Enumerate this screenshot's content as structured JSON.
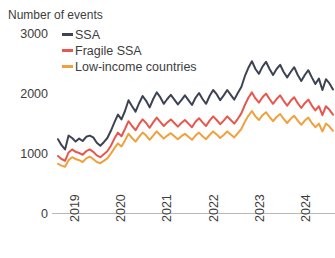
{
  "chart_data": {
    "type": "line",
    "title": "Number of events",
    "xlabel": "",
    "ylabel": "Number of events",
    "ylim": [
      0,
      3000
    ],
    "yticks": [
      0,
      1000,
      2000,
      3000
    ],
    "ytick_labels": [
      "0",
      "1000",
      "2000",
      "3000"
    ],
    "xticks": [
      "2019",
      "2020",
      "2021",
      "2022",
      "2023",
      "2024"
    ],
    "xtick_labels": [
      "2019",
      "2020",
      "2021",
      "2022",
      "2023",
      "2024"
    ],
    "grid": false,
    "legend_position": "top-left",
    "colors": {
      "ssa": "#3c4352",
      "fragile_ssa": "#e8574d",
      "low_income": "#f0a03c",
      "axis": "#9a9a9a",
      "text": "#3d3d3d"
    },
    "x_start": 2019.0,
    "x_end": 2024.75,
    "series": [
      {
        "name": "SSA",
        "color": "#3c4352",
        "values": [
          1230,
          1130,
          1060,
          1290,
          1250,
          1190,
          1240,
          1200,
          1270,
          1290,
          1260,
          1170,
          1120,
          1180,
          1250,
          1370,
          1510,
          1640,
          1560,
          1700,
          1880,
          1780,
          1690,
          1830,
          1950,
          1870,
          1760,
          1900,
          2010,
          1930,
          1820,
          1900,
          1970,
          1890,
          1810,
          1880,
          1960,
          1880,
          1800,
          1920,
          2000,
          1900,
          1820,
          1950,
          2050,
          1980,
          1880,
          1960,
          2050,
          1970,
          1890,
          2000,
          2100,
          2280,
          2420,
          2530,
          2400,
          2320,
          2440,
          2520,
          2400,
          2300,
          2400,
          2470,
          2350,
          2260,
          2350,
          2430,
          2300,
          2200,
          2300,
          2380,
          2260,
          2150,
          2240,
          2050,
          2230,
          2160,
          2060
        ]
      },
      {
        "name": "Fragile SSA",
        "color": "#e8574d",
        "values": [
          950,
          900,
          870,
          1010,
          1060,
          1020,
          1000,
          970,
          1030,
          1060,
          1020,
          960,
          930,
          980,
          1030,
          1120,
          1240,
          1340,
          1280,
          1400,
          1530,
          1450,
          1380,
          1480,
          1560,
          1500,
          1420,
          1510,
          1590,
          1520,
          1450,
          1510,
          1560,
          1500,
          1440,
          1500,
          1550,
          1490,
          1430,
          1520,
          1580,
          1510,
          1450,
          1540,
          1610,
          1550,
          1480,
          1540,
          1610,
          1550,
          1490,
          1570,
          1660,
          1800,
          1920,
          2010,
          1910,
          1840,
          1930,
          1990,
          1900,
          1820,
          1900,
          1960,
          1870,
          1790,
          1870,
          1930,
          1830,
          1750,
          1830,
          1890,
          1790,
          1710,
          1780,
          1630,
          1780,
          1720,
          1640
        ]
      },
      {
        "name": "Low-income countries",
        "color": "#f0a03c",
        "values": [
          820,
          790,
          770,
          880,
          930,
          900,
          880,
          850,
          910,
          940,
          900,
          850,
          830,
          870,
          910,
          990,
          1080,
          1160,
          1110,
          1210,
          1320,
          1250,
          1190,
          1270,
          1340,
          1290,
          1220,
          1290,
          1360,
          1300,
          1240,
          1290,
          1330,
          1280,
          1230,
          1280,
          1320,
          1270,
          1220,
          1290,
          1340,
          1280,
          1230,
          1300,
          1360,
          1310,
          1250,
          1300,
          1360,
          1310,
          1260,
          1330,
          1400,
          1520,
          1620,
          1700,
          1610,
          1550,
          1630,
          1680,
          1600,
          1530,
          1600,
          1650,
          1570,
          1500,
          1570,
          1620,
          1540,
          1470,
          1540,
          1590,
          1500,
          1430,
          1490,
          1360,
          1490,
          1440,
          1370
        ]
      }
    ]
  },
  "legend": {
    "items": [
      {
        "label": "SSA",
        "color": "#3c4352"
      },
      {
        "label": "Fragile SSA",
        "color": "#e8574d"
      },
      {
        "label": "Low-income countries",
        "color": "#f0a03c"
      }
    ]
  },
  "yaxis": {
    "t3": "3000",
    "t2": "2000",
    "t1": "1000",
    "t0": "0"
  },
  "xaxis": {
    "y0": "2019",
    "y1": "2020",
    "y2": "2021",
    "y3": "2022",
    "y4": "2023",
    "y5": "2024"
  },
  "header": {
    "title": "Number of events"
  }
}
